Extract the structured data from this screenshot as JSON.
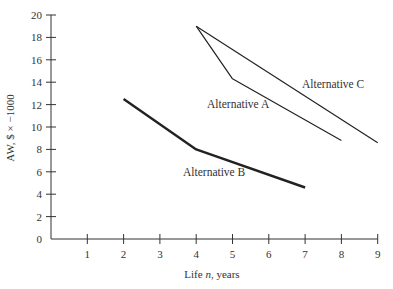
{
  "chart_data": {
    "type": "line",
    "title": "",
    "xlabel": "Life n, years",
    "ylabel": "AW, $ × −1000",
    "xlim": [
      0,
      9
    ],
    "ylim": [
      0,
      20
    ],
    "x_ticks": [
      1,
      2,
      3,
      4,
      5,
      6,
      7,
      8,
      9
    ],
    "y_ticks": [
      0,
      2,
      4,
      6,
      8,
      10,
      12,
      14,
      16,
      18,
      20
    ],
    "grid": false,
    "legend": "inline labels",
    "series": [
      {
        "name": "Alternative A",
        "x": [
          4,
          5,
          8
        ],
        "y": [
          19.0,
          14.3,
          8.8
        ],
        "stroke_width": 1.2
      },
      {
        "name": "Alternative B",
        "x": [
          2,
          4,
          7
        ],
        "y": [
          12.5,
          8.0,
          4.6
        ],
        "stroke_width": 2.4
      },
      {
        "name": "Alternative C",
        "x": [
          4,
          9
        ],
        "y": [
          19.0,
          8.6
        ],
        "stroke_width": 1.2
      }
    ]
  },
  "labels": {
    "xlabel_prefix": "Life ",
    "xlabel_var": "n",
    "xlabel_suffix": ", years",
    "ylabel": "AW, $ × −1000",
    "alt_a": "Alternative A",
    "alt_b": "Alternative B",
    "alt_c": "Alternative C"
  },
  "colors": {
    "line": "#222222",
    "axis": "#333333"
  }
}
